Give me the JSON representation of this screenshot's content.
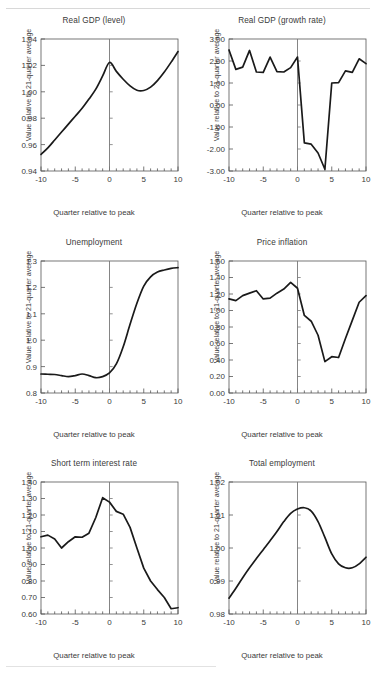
{
  "figure": {
    "shared_xlabel": "Quarter relative to peak",
    "shared_ylabel": "Value relative to 21-quarter average",
    "axis_color": "#555555",
    "line_color": "#1a1a1a",
    "vline_color": "#777777",
    "background": "#ffffff"
  },
  "chart_data": [
    {
      "type": "line",
      "title": "Real GDP (level)",
      "xlabel": "Quarter relative to peak",
      "ylabel": "Value relative to 21-quarter average",
      "xlim": [
        -10,
        10
      ],
      "ylim": [
        0.94,
        1.04
      ],
      "xticks": [
        -10,
        -5,
        0,
        5,
        10
      ],
      "xticklabels": [
        "-10",
        "-5",
        "0",
        "5",
        "10"
      ],
      "yticks": [
        0.94,
        0.96,
        0.98,
        1.0,
        1.02,
        1.04
      ],
      "yticklabels": [
        "0.94",
        "0.96",
        "0.98",
        "1.00",
        "1.02",
        "1.04"
      ],
      "grid": false,
      "legend": "none",
      "vline_at": 0,
      "x": [
        -10,
        -9,
        -8,
        -7,
        -6,
        -5,
        -4,
        -3,
        -2,
        -1,
        0,
        1,
        2,
        3,
        4,
        5,
        6,
        7,
        8,
        9,
        10
      ],
      "values": [
        0.9525,
        0.9575,
        0.9635,
        0.9695,
        0.9755,
        0.9815,
        0.9875,
        0.9945,
        1.002,
        1.012,
        1.0222,
        1.0155,
        1.0095,
        1.0045,
        1.0012,
        1.001,
        1.0035,
        1.0085,
        1.015,
        1.0225,
        1.0305
      ]
    },
    {
      "type": "line",
      "title": "Real GDP (growth rate)",
      "xlabel": "Quarter relative to peak",
      "ylabel": "Value relative to 21-quarter average",
      "xlim": [
        -10,
        10
      ],
      "ylim": [
        -3.0,
        3.0
      ],
      "xticks": [
        -10,
        -5,
        0,
        5,
        10
      ],
      "xticklabels": [
        "-10",
        "-5",
        "0",
        "5",
        "10"
      ],
      "yticks": [
        -3.0,
        -2.0,
        -1.0,
        0.0,
        1.0,
        2.0,
        3.0
      ],
      "yticklabels": [
        "-3.00",
        "-2.00",
        "-1.00",
        "0.00",
        "1.00",
        "2.00",
        "3.00"
      ],
      "grid": false,
      "legend": "none",
      "vline_at": 0,
      "x": [
        -10,
        -9,
        -8,
        -7,
        -6,
        -5,
        -4,
        -3,
        -2,
        -1,
        0,
        1,
        2,
        3,
        4,
        5,
        6,
        7,
        8,
        9,
        10
      ],
      "values": [
        2.5,
        1.62,
        1.72,
        2.48,
        1.5,
        1.48,
        2.18,
        1.52,
        1.5,
        1.7,
        2.18,
        -1.72,
        -1.78,
        -2.18,
        -2.92,
        1.0,
        1.02,
        1.55,
        1.48,
        2.1,
        1.88
      ]
    },
    {
      "type": "line",
      "title": "Unemployment",
      "xlabel": "Quarter relative to peak",
      "ylabel": "Value relative to 21-quarter average",
      "xlim": [
        -10,
        10
      ],
      "ylim": [
        0.8,
        1.3
      ],
      "xticks": [
        -10,
        -5,
        0,
        5,
        10
      ],
      "xticklabels": [
        "-10",
        "-5",
        "0",
        "5",
        "10"
      ],
      "yticks": [
        0.8,
        0.9,
        1.0,
        1.1,
        1.2,
        1.3
      ],
      "yticklabels": [
        "0.8",
        "0.9",
        "1.0",
        "1.1",
        "1.2",
        "1.3"
      ],
      "grid": false,
      "legend": "none",
      "vline_at": 0,
      "x": [
        -10,
        -9,
        -8,
        -7,
        -6,
        -5,
        -4,
        -3,
        -2,
        -1,
        0,
        1,
        2,
        3,
        4,
        5,
        6,
        7,
        8,
        9,
        10
      ],
      "values": [
        0.872,
        0.871,
        0.87,
        0.866,
        0.862,
        0.866,
        0.872,
        0.866,
        0.858,
        0.862,
        0.876,
        0.91,
        0.975,
        1.06,
        1.14,
        1.205,
        1.24,
        1.258,
        1.266,
        1.272,
        1.275
      ]
    },
    {
      "type": "line",
      "title": "Price inflation",
      "xlabel": "Quarter relative to peak",
      "ylabel": "Value relative to 21-quarter average",
      "xlim": [
        -10,
        10
      ],
      "ylim": [
        0.0,
        1.6
      ],
      "xticks": [
        -10,
        -5,
        0,
        5,
        10
      ],
      "xticklabels": [
        "-10",
        "-5",
        "0",
        "5",
        "10"
      ],
      "yticks": [
        0.0,
        0.2,
        0.4,
        0.6,
        0.8,
        1.0,
        1.2,
        1.4,
        1.6
      ],
      "yticklabels": [
        "0.00",
        "0.20",
        "0.40",
        "0.60",
        "0.80",
        "1.00",
        "1.20",
        "1.40",
        "1.60"
      ],
      "grid": false,
      "legend": "none",
      "vline_at": 0,
      "x": [
        -10,
        -9,
        -8,
        -7,
        -6,
        -5,
        -4,
        -3,
        -2,
        -1,
        0,
        1,
        2,
        3,
        4,
        5,
        6,
        7,
        8,
        9,
        10
      ],
      "values": [
        1.14,
        1.12,
        1.18,
        1.21,
        1.24,
        1.14,
        1.15,
        1.21,
        1.26,
        1.34,
        1.27,
        0.94,
        0.87,
        0.7,
        0.38,
        0.44,
        0.43,
        0.66,
        0.88,
        1.1,
        1.18
      ]
    },
    {
      "type": "line",
      "title": "Short term interest rate",
      "xlabel": "Quarter relative to peak",
      "ylabel": "Value relative to 21-quarter average",
      "xlim": [
        -10,
        10
      ],
      "ylim": [
        0.6,
        1.4
      ],
      "xticks": [
        -10,
        -5,
        0,
        5,
        10
      ],
      "xticklabels": [
        "-10",
        "-5",
        "0",
        "5",
        "10"
      ],
      "yticks": [
        0.6,
        0.7,
        0.8,
        0.9,
        1.0,
        1.1,
        1.2,
        1.3,
        1.4
      ],
      "yticklabels": [
        "0.60",
        "0.70",
        "0.80",
        "0.90",
        "1.00",
        "1.10",
        "1.20",
        "1.30",
        "1.40"
      ],
      "grid": false,
      "legend": "none",
      "vline_at": 0,
      "x": [
        -10,
        -9,
        -8,
        -7,
        -6,
        -5,
        -4,
        -3,
        -2,
        -1,
        0,
        1,
        2,
        3,
        4,
        5,
        6,
        7,
        8,
        9,
        10
      ],
      "values": [
        1.068,
        1.078,
        1.055,
        1.0,
        1.038,
        1.068,
        1.065,
        1.09,
        1.185,
        1.305,
        1.278,
        1.222,
        1.205,
        1.125,
        1.0,
        0.878,
        0.8,
        0.748,
        0.7,
        0.632,
        0.638
      ]
    },
    {
      "type": "line",
      "title": "Total employment",
      "xlabel": "Quarter relative to peak",
      "ylabel": "Value relative to 21-quarter average",
      "xlim": [
        -10,
        10
      ],
      "ylim": [
        0.98,
        1.02
      ],
      "xticks": [
        -10,
        -5,
        0,
        5,
        10
      ],
      "xticklabels": [
        "-10",
        "-5",
        "0",
        "5",
        "10"
      ],
      "yticks": [
        0.98,
        0.99,
        1.0,
        1.01,
        1.02
      ],
      "yticklabels": [
        "0.98",
        "0.99",
        "1.00",
        "1.01",
        "1.02"
      ],
      "grid": false,
      "legend": "none",
      "vline_at": 0,
      "x": [
        -10,
        -9,
        -8,
        -7,
        -6,
        -5,
        -4,
        -3,
        -2,
        -1,
        0,
        1,
        2,
        3,
        4,
        5,
        6,
        7,
        8,
        9,
        10
      ],
      "values": [
        0.9848,
        0.9878,
        0.991,
        0.994,
        0.9968,
        0.9995,
        1.0022,
        1.005,
        1.008,
        1.0105,
        1.0118,
        1.0122,
        1.0112,
        1.008,
        1.0032,
        0.9982,
        0.9952,
        0.994,
        0.994,
        0.9952,
        0.9972
      ]
    }
  ]
}
